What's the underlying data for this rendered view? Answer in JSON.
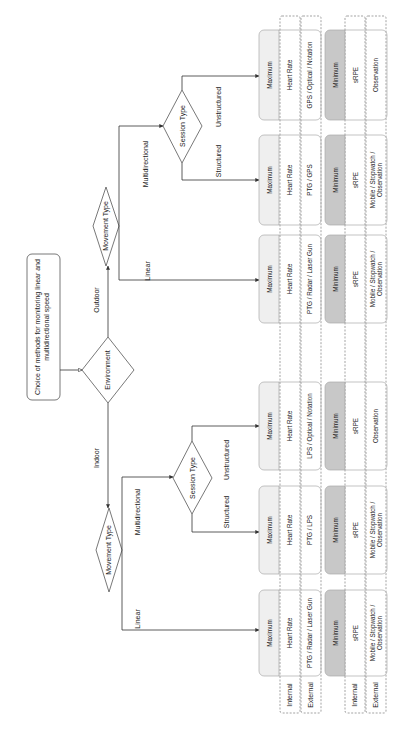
{
  "title": "Choice of methods for monitoring linear and multidirectional speed",
  "title_lines": [
    "Choice of methods for monitoring linear and",
    "multidirectional speed"
  ],
  "decisions": {
    "environment": "Environment",
    "movement_type": "Movement Type",
    "session_type": "Session Type"
  },
  "edges": {
    "outdoor": "Outdoor",
    "indoor": "Indoor",
    "linear": "Linear",
    "multidirectional": "Multidirectional",
    "structured": "Structured",
    "unstructured": "Unstructured"
  },
  "row_labels": {
    "internal": "Internal",
    "external": "External"
  },
  "levels": {
    "maximum": "Maximum",
    "minimum": "Minimum"
  },
  "outcomes": [
    {
      "id": "outdoor-multidirectional-unstructured",
      "maximum": {
        "internal": [
          "Heart Rate"
        ],
        "external": [
          "GPS / Optical / Notation"
        ]
      },
      "minimum": {
        "internal": [
          "sRPE"
        ],
        "external": [
          "Observation"
        ]
      }
    },
    {
      "id": "outdoor-multidirectional-structured",
      "maximum": {
        "internal": [
          "Heart Rate"
        ],
        "external": [
          "PTG / GPS"
        ]
      },
      "minimum": {
        "internal": [
          "sRPE"
        ],
        "external": [
          "Mobile / Stopwatch /",
          "Observation"
        ]
      }
    },
    {
      "id": "outdoor-linear",
      "maximum": {
        "internal": [
          "Heart Rate"
        ],
        "external": [
          "PTG / Radar / Laser Gun"
        ]
      },
      "minimum": {
        "internal": [
          "sRPE"
        ],
        "external": [
          "Mobile / Stopwatch /",
          "Observation"
        ]
      }
    },
    {
      "id": "indoor-multidirectional-unstructured",
      "maximum": {
        "internal": [
          "Heart Rate"
        ],
        "external": [
          "LPS / Optical / Notation"
        ]
      },
      "minimum": {
        "internal": [
          "sRPE"
        ],
        "external": [
          "Observation"
        ]
      }
    },
    {
      "id": "indoor-multidirectional-structured",
      "maximum": {
        "internal": [
          "Heart Rate"
        ],
        "external": [
          "PTG / LPS"
        ]
      },
      "minimum": {
        "internal": [
          "sRPE"
        ],
        "external": [
          "Mobile / Stopwatch /",
          "Observation"
        ]
      }
    },
    {
      "id": "indoor-linear",
      "maximum": {
        "internal": [
          "Heart Rate"
        ],
        "external": [
          "PTG / Radar / Laser Gun"
        ]
      },
      "minimum": {
        "internal": [
          "sRPE"
        ],
        "external": [
          "Mobile / Stopwatch /",
          "Observation"
        ]
      }
    }
  ],
  "colors": {
    "maximum_header": "#efefef",
    "minimum_header": "#c8c8c8",
    "line": "#333333"
  }
}
